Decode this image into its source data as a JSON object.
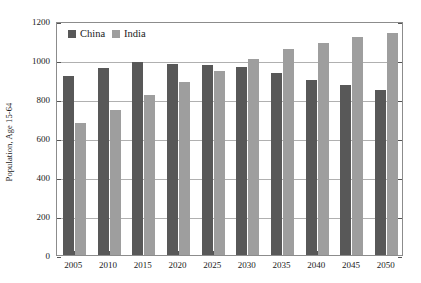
{
  "chart_data": {
    "type": "bar",
    "title": "",
    "xlabel": "",
    "ylabel": "Population, Age 15-64",
    "ylim": [
      0,
      1200
    ],
    "ytick_step": 200,
    "yticks": [
      "0",
      "200",
      "400",
      "600",
      "800",
      "1000",
      "1200"
    ],
    "grid": true,
    "legend_position": "top-left-inside",
    "categories": [
      "2005",
      "2010",
      "2015",
      "2020",
      "2025",
      "2030",
      "2035",
      "2040",
      "2045",
      "2050"
    ],
    "series": [
      {
        "name": "China",
        "color": "#585858",
        "values": [
          920,
          960,
          988,
          980,
          972,
          962,
          932,
          895,
          872,
          848
        ]
      },
      {
        "name": "India",
        "color": "#9e9e9e",
        "values": [
          678,
          745,
          823,
          885,
          945,
          1005,
          1055,
          1088,
          1118,
          1140
        ]
      }
    ]
  },
  "legend": {
    "entries": [
      {
        "label": "China",
        "color": "#585858"
      },
      {
        "label": "India",
        "color": "#9e9e9e"
      }
    ]
  },
  "axes": {
    "y_title": "Population, Age 15-64"
  }
}
